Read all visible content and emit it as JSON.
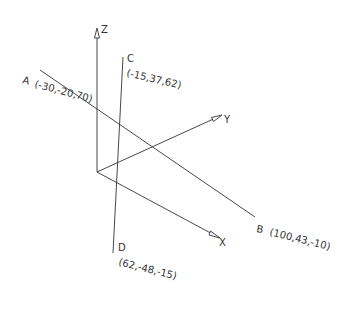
{
  "diagram": {
    "type": "3d-axes-with-lines",
    "colors": {
      "line": "#333333",
      "background": "#ffffff"
    },
    "origin": [
      97,
      172
    ],
    "axes": {
      "x": {
        "label": "X",
        "end": [
          220,
          238
        ]
      },
      "y": {
        "label": "Y",
        "end": [
          222,
          115
        ]
      },
      "z": {
        "label": "Z",
        "end": [
          97,
          28
        ]
      }
    },
    "points": {
      "A": {
        "name": "A",
        "coords": "(-30,-20,70)",
        "pos": [
          40,
          70
        ]
      },
      "B": {
        "name": "B",
        "coords": "(100,43,-10)",
        "pos": [
          255,
          217
        ]
      },
      "C": {
        "name": "C",
        "coords": "(-15,37,62)",
        "pos": [
          123,
          57
        ]
      },
      "D": {
        "name": "D",
        "coords": "(62,-48,-15)",
        "pos": [
          113,
          253
        ]
      }
    },
    "lines": [
      {
        "from": "A",
        "to": "B"
      },
      {
        "from": "C",
        "to": "D"
      }
    ]
  }
}
